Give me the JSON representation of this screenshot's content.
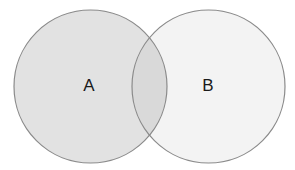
{
  "diagram": {
    "type": "venn",
    "background": "#ffffff",
    "stroke_color": "#8a8a8a",
    "sets": [
      {
        "id": "A",
        "label": "A",
        "cx": 90.5,
        "cy": 86.5,
        "r": 76.5,
        "fill": "#e2e2e2",
        "label_x": 89,
        "label_y": 91
      },
      {
        "id": "B",
        "label": "B",
        "cx": 208.5,
        "cy": 86.5,
        "r": 76.5,
        "fill": "#f3f3f3",
        "label_x": 208,
        "label_y": 91
      }
    ],
    "intersection": {
      "fill": "#d9d9d9"
    }
  }
}
